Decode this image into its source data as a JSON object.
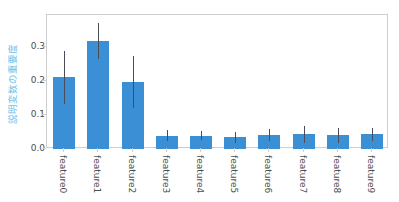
{
  "chart_data": {
    "type": "bar",
    "title": "",
    "xlabel": "",
    "ylabel": "説明変数の重要度",
    "categories": [
      "feature0",
      "feature1",
      "feature2",
      "feature3",
      "feature4",
      "feature5",
      "feature6",
      "feature7",
      "feature8",
      "feature9"
    ],
    "values": [
      0.21,
      0.317,
      0.196,
      0.039,
      0.039,
      0.035,
      0.041,
      0.043,
      0.04,
      0.043
    ],
    "errors": [
      0.077,
      0.053,
      0.077,
      0.017,
      0.013,
      0.016,
      0.019,
      0.024,
      0.021,
      0.019
    ],
    "error_type": "symmetric",
    "ylim": [
      0.0,
      0.3925
    ],
    "yticks": [
      0.0,
      0.1,
      0.2,
      0.3
    ],
    "ytick_labels": [
      "0.0",
      "0.1",
      "0.2",
      "0.3"
    ],
    "grid": false,
    "legend": null,
    "bar_color": "#3b8fd4",
    "error_color": "#4a4a58",
    "ylabel_color": "#6ec1ec",
    "tick_label_color": "#4d4d4d",
    "frame_color": "#cfcfcf",
    "background": "#ffffff"
  }
}
